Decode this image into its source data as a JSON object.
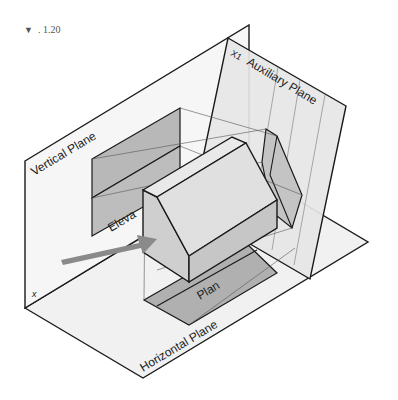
{
  "figure": {
    "number_marker": "▼",
    "number": ". 1.20"
  },
  "labels": {
    "vertical_plane": "Vertical Plane",
    "auxiliary_plane": "Auxiliary Plane",
    "aux_axis": "X1",
    "horizontal_plane": "Horizontal Plane",
    "elevation": "Eleva",
    "plan": "Plan",
    "x_axis": "x"
  },
  "colors": {
    "plane_fill": "#f1f1f1",
    "aux_plane_fill": "#e6e6e6",
    "projection_fill": "#b8b8b8",
    "house_front": "#d6d6d6",
    "house_roof": "#e4e4e4",
    "house_side": "#c8c8c8",
    "arrow": "#8a8a8a",
    "line": "#1a1a1a"
  }
}
